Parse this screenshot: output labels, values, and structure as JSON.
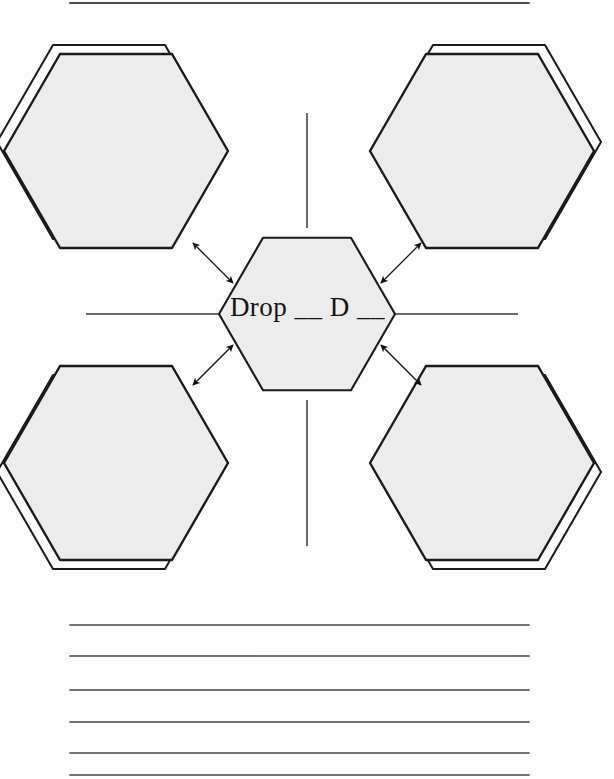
{
  "page": {
    "background_color": "#fdfdfd"
  },
  "colors": {
    "ink": "#1a1a1a",
    "hex_fill": "#ececec",
    "hex_stroke": "#1a1a1a",
    "outline_fill": "#ffffff",
    "rule_line": "#444444",
    "spoke_line": "#3a3a3a"
  },
  "top_rule": {
    "name": "top-border-rule",
    "x1": 70,
    "x2": 529,
    "y": 3
  },
  "center_hexagon": {
    "label": "Drop __ D __",
    "label_text": "Drop",
    "blank_one": "__",
    "letter": "D",
    "blank_two": "__",
    "cx": 307,
    "cy": 314,
    "radius": 88,
    "fill": "#ececec"
  },
  "outer_hexagons": [
    {
      "name": "hexagon-top-left",
      "cx": 116,
      "cy": 151,
      "radius": 112,
      "offset_x": -7,
      "offset_y": -9,
      "fill": "#ececec"
    },
    {
      "name": "hexagon-top-right",
      "cx": 482,
      "cy": 151,
      "radius": 112,
      "offset_x": 7,
      "offset_y": -9,
      "fill": "#ececec"
    },
    {
      "name": "hexagon-bottom-left",
      "cx": 116,
      "cy": 463,
      "radius": 112,
      "offset_x": -7,
      "offset_y": 9,
      "fill": "#ececec"
    },
    {
      "name": "hexagon-bottom-right",
      "cx": 482,
      "cy": 463,
      "radius": 112,
      "offset_x": 7,
      "offset_y": 9,
      "fill": "#ececec"
    }
  ],
  "spokes": [
    {
      "name": "spoke-up",
      "x1": 307,
      "y1": 113,
      "x2": 307,
      "y2": 228
    },
    {
      "name": "spoke-down",
      "x1": 307,
      "y1": 400,
      "x2": 307,
      "y2": 546
    },
    {
      "name": "spoke-left",
      "x1": 86,
      "y1": 314,
      "x2": 219,
      "y2": 314
    },
    {
      "name": "spoke-right",
      "x1": 395,
      "y1": 314,
      "x2": 518,
      "y2": 314
    }
  ],
  "arrows": [
    {
      "name": "arrow-up-left",
      "x1": 233,
      "y1": 283,
      "x2": 193,
      "y2": 243,
      "double": true
    },
    {
      "name": "arrow-up-right",
      "x1": 381,
      "y1": 283,
      "x2": 421,
      "y2": 243,
      "double": true
    },
    {
      "name": "arrow-down-left",
      "x1": 233,
      "y1": 345,
      "x2": 193,
      "y2": 385,
      "double": true
    },
    {
      "name": "arrow-down-right",
      "x1": 381,
      "y1": 345,
      "x2": 421,
      "y2": 385,
      "double": true
    }
  ],
  "writing_lines": {
    "name": "writing-lines",
    "count": 6,
    "x1": 70,
    "x2": 529,
    "y_values": [
      625,
      656,
      690,
      722,
      753,
      775
    ],
    "color": "#444444"
  },
  "footer": {
    "caption": ""
  }
}
